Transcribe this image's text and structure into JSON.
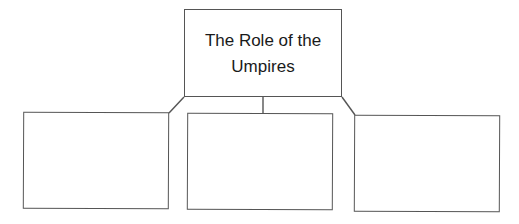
{
  "diagram": {
    "type": "hierarchy",
    "root": {
      "label": "The Role of the Umpires"
    },
    "children": [
      {
        "label": ""
      },
      {
        "label": ""
      },
      {
        "label": ""
      }
    ],
    "colors": {
      "line": "#555555",
      "text": "#1a1a1a",
      "background": "#ffffff"
    }
  }
}
